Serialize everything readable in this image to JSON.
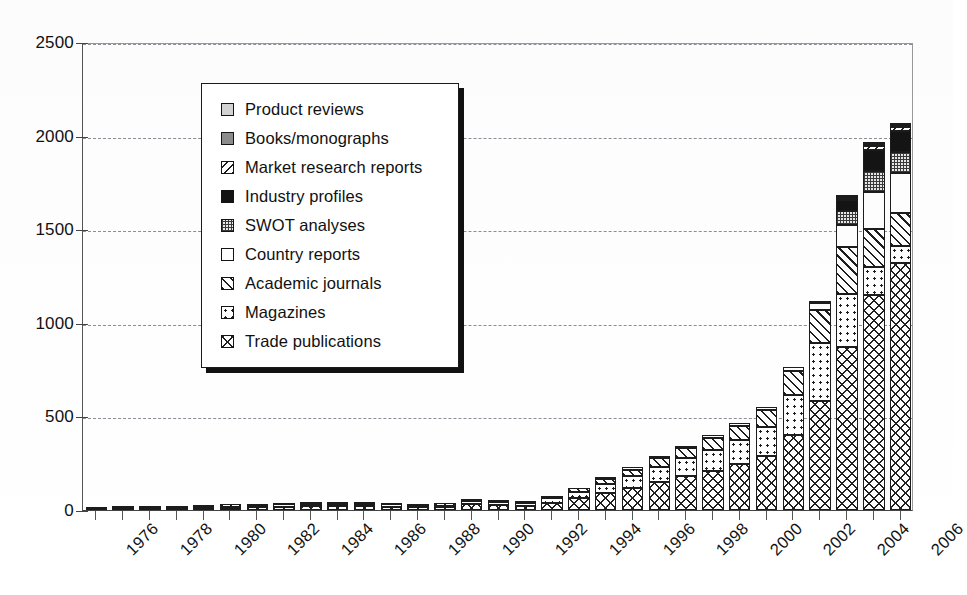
{
  "chart_data": {
    "type": "bar",
    "variant": "stacked",
    "title": "",
    "subtitle": "",
    "xlabel": "",
    "ylabel": "",
    "ylim": [
      0,
      2500
    ],
    "ytick_values": [
      0,
      500,
      1000,
      1500,
      2000,
      2500
    ],
    "ytick_labels": [
      "0",
      "500",
      "1000",
      "1500",
      "2000",
      "2500"
    ],
    "grid": true,
    "grid_style": "dashed-horizontal",
    "legend_position": "upper-left-inset",
    "x_label_rotation": -45,
    "categories": [
      "1976",
      "1977",
      "1978",
      "1979",
      "1980",
      "1981",
      "1982",
      "1983",
      "1984",
      "1985",
      "1986",
      "1987",
      "1988",
      "1989",
      "1990",
      "1991",
      "1992",
      "1993",
      "1994",
      "1995",
      "1996",
      "1997",
      "1998",
      "1999",
      "2000",
      "2001",
      "2002",
      "2003",
      "2004",
      "2005",
      "2006"
    ],
    "xtick_labels_shown": [
      "1976",
      "1978",
      "1980",
      "1982",
      "1984",
      "1986",
      "1988",
      "1990",
      "1992",
      "1994",
      "1996",
      "1998",
      "2000",
      "2002",
      "2004",
      "2006"
    ],
    "series": [
      {
        "name": "Trade publications",
        "pattern": "crosshatch",
        "stack_order": 1,
        "values": [
          4,
          6,
          8,
          8,
          10,
          12,
          14,
          18,
          20,
          20,
          20,
          18,
          14,
          16,
          30,
          28,
          24,
          40,
          62,
          90,
          118,
          150,
          180,
          210,
          245,
          290,
          400,
          580,
          870,
          1150,
          1320
        ]
      },
      {
        "name": "Magazines",
        "pattern": "dots",
        "stack_order": 2,
        "values": [
          2,
          3,
          4,
          4,
          5,
          6,
          7,
          9,
          10,
          10,
          10,
          9,
          7,
          8,
          16,
          15,
          13,
          22,
          34,
          48,
          62,
          80,
          96,
          112,
          130,
          155,
          215,
          310,
          285,
          150,
          90
        ]
      },
      {
        "name": "Academic journals",
        "pattern": "diagonal-hatch",
        "stack_order": 3,
        "values": [
          1,
          2,
          2,
          2,
          3,
          3,
          4,
          5,
          6,
          6,
          6,
          5,
          4,
          5,
          9,
          9,
          8,
          13,
          20,
          28,
          36,
          46,
          56,
          65,
          76,
          90,
          125,
          180,
          250,
          200,
          175
        ]
      },
      {
        "name": "Country reports",
        "pattern": "solid-white",
        "stack_order": 4,
        "values": [
          0,
          0,
          0,
          0,
          0,
          0,
          0,
          0,
          0,
          0,
          0,
          0,
          0,
          0,
          0,
          0,
          0,
          0,
          0,
          4,
          6,
          8,
          10,
          12,
          14,
          18,
          24,
          34,
          120,
          200,
          215
        ]
      },
      {
        "name": "SWOT analyses",
        "pattern": "fine-grid",
        "stack_order": 5,
        "values": [
          0,
          0,
          0,
          0,
          0,
          0,
          0,
          0,
          0,
          0,
          0,
          0,
          0,
          0,
          0,
          0,
          0,
          0,
          0,
          0,
          0,
          0,
          0,
          0,
          0,
          0,
          0,
          12,
          70,
          110,
          115
        ]
      },
      {
        "name": "Industry profiles",
        "pattern": "solid-black",
        "stack_order": 6,
        "values": [
          0,
          0,
          0,
          0,
          0,
          0,
          0,
          0,
          0,
          0,
          0,
          0,
          0,
          0,
          0,
          0,
          0,
          0,
          0,
          0,
          0,
          0,
          0,
          0,
          0,
          0,
          0,
          0,
          60,
          115,
          110
        ]
      },
      {
        "name": "Market research reports",
        "pattern": "back-diagonal-hatch",
        "stack_order": 7,
        "values": [
          0,
          0,
          0,
          0,
          0,
          0,
          0,
          0,
          0,
          0,
          0,
          0,
          0,
          0,
          0,
          0,
          0,
          0,
          0,
          0,
          0,
          0,
          0,
          0,
          0,
          0,
          0,
          0,
          12,
          20,
          22
        ]
      },
      {
        "name": "Books/monographs",
        "pattern": "solid-grey",
        "stack_order": 8,
        "values": [
          0,
          0,
          0,
          0,
          0,
          0,
          0,
          0,
          0,
          0,
          0,
          0,
          0,
          0,
          0,
          0,
          0,
          0,
          0,
          0,
          0,
          0,
          0,
          0,
          0,
          0,
          0,
          0,
          6,
          10,
          10
        ]
      },
      {
        "name": "Product reviews",
        "pattern": "solid-light-grey",
        "stack_order": 9,
        "values": [
          0,
          0,
          0,
          0,
          0,
          0,
          0,
          0,
          0,
          0,
          0,
          0,
          0,
          0,
          0,
          0,
          0,
          0,
          0,
          0,
          0,
          0,
          0,
          0,
          0,
          0,
          0,
          0,
          4,
          6,
          6
        ]
      }
    ],
    "totals": [
      7,
      11,
      14,
      14,
      18,
      21,
      25,
      32,
      36,
      36,
      36,
      32,
      25,
      29,
      55,
      52,
      45,
      75,
      116,
      170,
      222,
      284,
      342,
      399,
      465,
      553,
      764,
      1116,
      1677,
      1961,
      2063
    ]
  },
  "legend": {
    "items": [
      {
        "label": "Product reviews",
        "pattern": "solid-light-grey"
      },
      {
        "label": "Books/monographs",
        "pattern": "solid-grey"
      },
      {
        "label": "Market research reports",
        "pattern": "back-diagonal-hatch"
      },
      {
        "label": "Industry profiles",
        "pattern": "solid-black"
      },
      {
        "label": "SWOT analyses",
        "pattern": "fine-grid"
      },
      {
        "label": "Country reports",
        "pattern": "solid-white"
      },
      {
        "label": "Academic journals",
        "pattern": "diagonal-hatch"
      },
      {
        "label": "Magazines",
        "pattern": "dots"
      },
      {
        "label": "Trade publications",
        "pattern": "crosshatch"
      }
    ]
  },
  "colors": {
    "axis": "#444444",
    "gridline": "#8d8d96",
    "outline": "#1c1c1c",
    "background": "#ffffff",
    "black_fill": "#141414",
    "grey_fill": "#8b8b8b",
    "light_grey_fill": "#d2d2d2"
  }
}
